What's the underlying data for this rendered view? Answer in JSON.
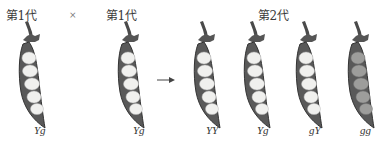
{
  "title_parent_left": "第1代",
  "title_parent_right": "第1代",
  "cross_symbol": "×",
  "title_offspring": "第2代",
  "colors": {
    "pod_outline": "#3c3c3c",
    "pod_shell": "#555555",
    "pea_yellow": "#f1f1ef",
    "pea_green": "#9a9a98"
  },
  "parents": [
    {
      "genotype": "Yg",
      "seed_color": "yellow"
    },
    {
      "genotype": "Yg",
      "seed_color": "yellow"
    }
  ],
  "arrow": "arrow-right-icon",
  "offspring": [
    {
      "genotype": "YY",
      "seed_color": "yellow"
    },
    {
      "genotype": "Yg",
      "seed_color": "yellow"
    },
    {
      "genotype": "gY",
      "seed_color": "yellow"
    },
    {
      "genotype": "gg",
      "seed_color": "green"
    }
  ]
}
